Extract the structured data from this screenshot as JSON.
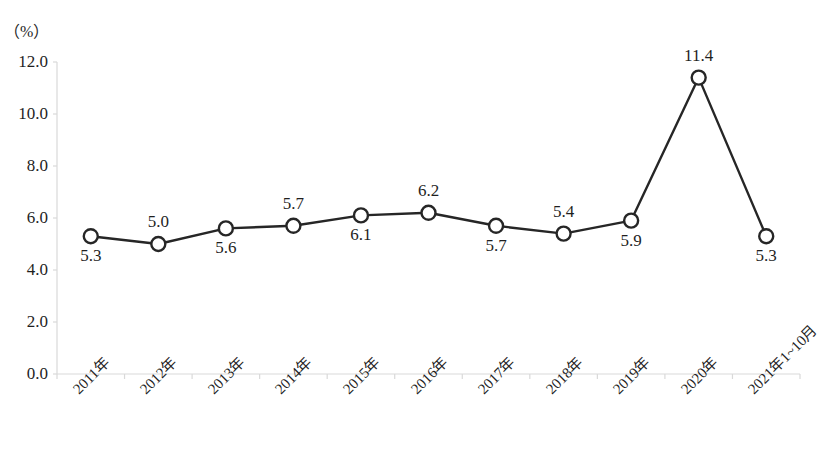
{
  "chart_data": {
    "type": "line",
    "title": "",
    "subtitle": "",
    "unit_label": "（%）",
    "xlabel": "",
    "ylabel": "",
    "categories": [
      "2011年",
      "2012年",
      "2013年",
      "2014年",
      "2015年",
      "2016年",
      "2017年",
      "2018年",
      "2019年",
      "2020年",
      "2021年1~10月"
    ],
    "values": [
      5.3,
      5.0,
      5.6,
      5.7,
      6.1,
      6.2,
      5.7,
      5.4,
      5.9,
      11.4,
      5.3
    ],
    "data_labels": [
      "5.3",
      "5.0",
      "5.6",
      "5.7",
      "6.1",
      "6.2",
      "5.7",
      "5.4",
      "5.9",
      "11.4",
      "5.3"
    ],
    "label_positions": [
      "below",
      "above",
      "below",
      "above",
      "below",
      "above",
      "below",
      "above",
      "below",
      "above",
      "below"
    ],
    "ylim": [
      0.0,
      12.0
    ],
    "ytick_labels": [
      "0.0",
      "2.0",
      "4.0",
      "6.0",
      "8.0",
      "10.0",
      "12.0"
    ],
    "ytick_values": [
      0.0,
      2.0,
      4.0,
      6.0,
      8.0,
      10.0,
      12.0
    ],
    "grid": false,
    "legend": "none",
    "series_color": "#262626",
    "marker": "open-circle",
    "marker_fill": "#ffffff",
    "axis_color": "#d9d9d9"
  }
}
